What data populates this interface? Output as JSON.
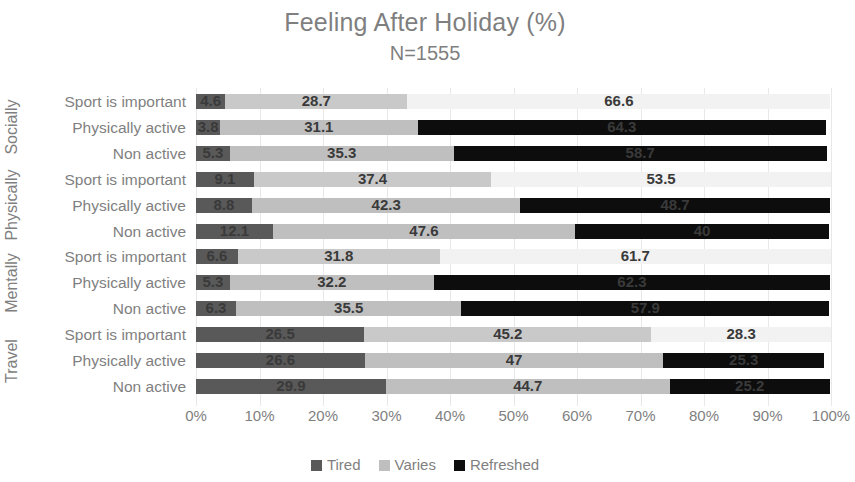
{
  "chart_data": {
    "type": "bar",
    "orientation": "horizontal",
    "stacked": true,
    "stack_mode": "percent",
    "title": "Feeling After Holiday (%)",
    "subtitle": "N=1555",
    "xlabel": "",
    "ylabel": "",
    "xlim": [
      0,
      100
    ],
    "grid": true,
    "legend_position": "bottom",
    "x_ticks": [
      "0%",
      "10%",
      "20%",
      "30%",
      "40%",
      "50%",
      "60%",
      "70%",
      "80%",
      "90%",
      "100%"
    ],
    "series": [
      {
        "name": "Tired",
        "color": "#595959",
        "values": [
          4.6,
          3.8,
          5.3,
          9.1,
          8.8,
          12.1,
          6.6,
          5.3,
          6.3,
          26.5,
          26.6,
          29.9
        ]
      },
      {
        "name": "Varies",
        "color": "#bfbfbf",
        "values": [
          28.7,
          31.1,
          35.3,
          37.4,
          42.3,
          47.6,
          31.8,
          32.2,
          35.5,
          45.2,
          47.0,
          44.7
        ]
      },
      {
        "name": "Refreshed",
        "color": "#0d0d0d",
        "values": [
          66.6,
          64.3,
          58.7,
          53.5,
          48.7,
          40.0,
          61.7,
          62.3,
          57.9,
          28.3,
          25.3,
          25.2
        ]
      }
    ],
    "categories": [
      "Sport is important",
      "Physically active",
      "Non active",
      "Sport is important",
      "Physically active",
      "Non active",
      "Sport is important",
      "Physically active",
      "Non active",
      "Sport is important",
      "Physically active",
      "Non active"
    ],
    "value_labels": [
      [
        "4.6",
        "28.7",
        "66.6"
      ],
      [
        "3.8",
        "31.1",
        "64.3"
      ],
      [
        "5.3",
        "35.3",
        "58.7"
      ],
      [
        "9.1",
        "37.4",
        "53.5"
      ],
      [
        "8.8",
        "42.3",
        "48.7"
      ],
      [
        "12.1",
        "47.6",
        "40"
      ],
      [
        "6.6",
        "31.8",
        "61.7"
      ],
      [
        "5.3",
        "32.2",
        "62.3"
      ],
      [
        "6.3",
        "35.5",
        "57.9"
      ],
      [
        "26.5",
        "45.2",
        "28.3"
      ],
      [
        "26.6",
        "47",
        "25.3"
      ],
      [
        "29.9",
        "44.7",
        "25.2"
      ]
    ],
    "groups": [
      {
        "label": "Socially",
        "rows": [
          0,
          1,
          2
        ]
      },
      {
        "label": "Physically",
        "rows": [
          3,
          4,
          5
        ]
      },
      {
        "label": "Mentally",
        "rows": [
          6,
          7,
          8
        ]
      },
      {
        "label": "Travel",
        "rows": [
          9,
          10,
          11
        ]
      }
    ],
    "legend": [
      {
        "label": "Tired",
        "color": "#595959"
      },
      {
        "label": "Varies",
        "color": "#bfbfbf"
      },
      {
        "label": "Refreshed",
        "color": "#0d0d0d"
      }
    ],
    "faded_rows": [
      0,
      3,
      6,
      9
    ]
  },
  "colors": {
    "title": "#7f7f7f",
    "axis_text": "#7f7f7f",
    "gridline": "#e8e8e8",
    "value_label": "#3a3a3a",
    "background": "#ffffff"
  }
}
